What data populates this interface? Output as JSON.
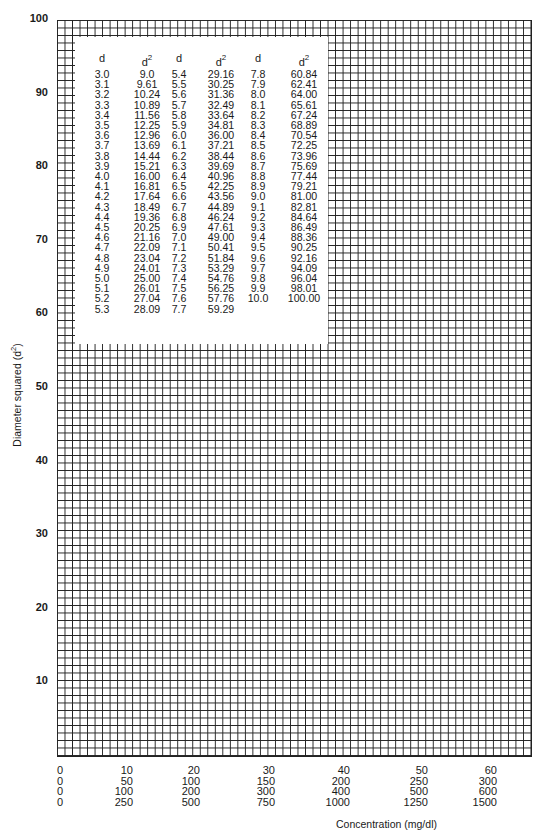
{
  "chart_data": {
    "type": "table",
    "title": "",
    "xlabel": "Concentration (mg/dl)",
    "ylabel": "Diameter squared (d2)",
    "ylim": [
      0,
      100
    ],
    "xlim": [
      0,
      60
    ],
    "grid": true,
    "y_ticks": [
      "100",
      "90",
      "80",
      "70",
      "60",
      "50",
      "40",
      "30",
      "20",
      "10"
    ],
    "x_tick_rows": [
      [
        "0",
        "10",
        "20",
        "30",
        "40",
        "50",
        "60"
      ],
      [
        "0",
        "50",
        "100",
        "150",
        "200",
        "250",
        "300"
      ],
      [
        "0",
        "100",
        "200",
        "300",
        "400",
        "500",
        "600"
      ],
      [
        "0",
        "250",
        "500",
        "750",
        "1000",
        "1250",
        "1500"
      ]
    ],
    "table": {
      "headers": [
        "d",
        "d2",
        "d",
        "d2",
        "d",
        "d2"
      ],
      "columns": [
        [
          "3.0",
          "3.1",
          "3.2",
          "3.3",
          "3.4",
          "3.5",
          "3.6",
          "3.7",
          "3.8",
          "3.9",
          "4.0",
          "4.1",
          "4.2",
          "4.3",
          "4.4",
          "4.5",
          "4.6",
          "4.7",
          "4.8",
          "4.9",
          "5.0",
          "5.1",
          "5.2",
          "5.3"
        ],
        [
          "9.0",
          "9.61",
          "10.24",
          "10.89",
          "11.56",
          "12.25",
          "12.96",
          "13.69",
          "14.44",
          "15.21",
          "16.00",
          "16.81",
          "17.64",
          "18.49",
          "19.36",
          "20.25",
          "21.16",
          "22.09",
          "23.04",
          "24.01",
          "25.00",
          "26.01",
          "27.04",
          "28.09"
        ],
        [
          "5.4",
          "5.5",
          "5.6",
          "5.7",
          "5.8",
          "5.9",
          "6.0",
          "6.1",
          "6.2",
          "6.3",
          "6.4",
          "6.5",
          "6.6",
          "6.7",
          "6.8",
          "6.9",
          "7.0",
          "7.1",
          "7.2",
          "7.3",
          "7.4",
          "7.5",
          "7.6",
          "7.7"
        ],
        [
          "29.16",
          "30.25",
          "31.36",
          "32.49",
          "33.64",
          "34.81",
          "36.00",
          "37.21",
          "38.44",
          "39.69",
          "40.96",
          "42.25",
          "43.56",
          "44.89",
          "46.24",
          "47.61",
          "49.00",
          "50.41",
          "51.84",
          "53.29",
          "54.76",
          "56.25",
          "57.76",
          "59.29"
        ],
        [
          "7.8",
          "7.9",
          "8.0",
          "8.1",
          "8.2",
          "8.3",
          "8.4",
          "8.5",
          "8.6",
          "8.7",
          "8.8",
          "8.9",
          "9.0",
          "9.1",
          "9.2",
          "9.3",
          "9.4",
          "9.5",
          "9.6",
          "9.7",
          "9.8",
          "9.9",
          "10.0"
        ],
        [
          "60.84",
          "62.41",
          "64.00",
          "65.61",
          "67.24",
          "68.89",
          "70.54",
          "72.25",
          "73.96",
          "75.69",
          "77.44",
          "79.21",
          "81.00",
          "82.81",
          "84.64",
          "86.49",
          "88.36",
          "90.25",
          "92.16",
          "94.09",
          "96.04",
          "98.01",
          "100.00"
        ]
      ]
    }
  },
  "axis": {
    "ylabel_main": "Diameter squared (d",
    "ylabel_sup": "2",
    "ylabel_end": ")",
    "xlabel": "Concentration (mg/dl)"
  },
  "table_header": {
    "d": "d",
    "d2_base": "d",
    "d2_sup": "2"
  }
}
